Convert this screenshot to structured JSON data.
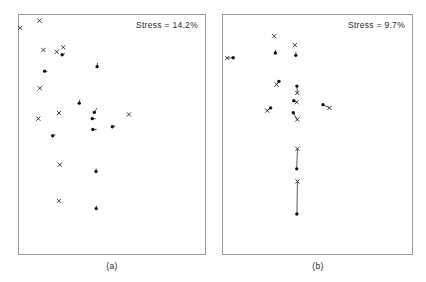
{
  "figure": {
    "type": "two-panel-mds-scatter",
    "background": "#ffffff",
    "marker_color": "#111111",
    "frame_color": "#9a9a9a"
  },
  "panels": [
    {
      "id": "a",
      "caption": "(a)",
      "stress_label": "Stress = 14.2%",
      "stress_value": 14.2
    },
    {
      "id": "b",
      "caption": "(b)",
      "stress_label": "Stress = 9.7%",
      "stress_value": 9.7
    }
  ],
  "chart_data": [
    {
      "type": "scatter",
      "panel": "a",
      "title": "Stress = 14.2%",
      "xlabel": "",
      "ylabel": "",
      "xlim": [
        0,
        188
      ],
      "ylim": [
        0,
        241
      ],
      "grid": false,
      "legend": "none",
      "axis_ticks": false,
      "note": "MDS configuration; cross markers are one configuration, filled circles the other, short line segments join corresponding pairs",
      "series": [
        {
          "name": "cross-markers",
          "marker": "x",
          "points": [
            {
              "x": 7,
              "y": 43
            },
            {
              "x": 110,
              "y": 19
            },
            {
              "x": 131,
              "y": 117
            },
            {
              "x": 112,
              "y": 245
            },
            {
              "x": 203,
              "y": 123
            },
            {
              "x": 238,
              "y": 108
            },
            {
              "x": 104,
              "y": 347
            },
            {
              "x": 215,
              "y": 328
            },
            {
              "x": 219,
              "y": 501
            },
            {
              "x": 215,
              "y": 622
            },
            {
              "x": 591,
              "y": 333
            }
          ]
        },
        {
          "name": "dot-markers",
          "marker": "circle",
          "points": [
            {
              "x": 232,
              "y": 133
            },
            {
              "x": 138,
              "y": 188
            },
            {
              "x": 420,
              "y": 173
            },
            {
              "x": 324,
              "y": 295
            },
            {
              "x": 405,
              "y": 326
            },
            {
              "x": 394,
              "y": 347
            },
            {
              "x": 397,
              "y": 383
            },
            {
              "x": 502,
              "y": 374
            },
            {
              "x": 181,
              "y": 404
            },
            {
              "x": 414,
              "y": 524
            },
            {
              "x": 415,
              "y": 648
            },
            {
              "x": 1166,
              "y": 325
            }
          ]
        }
      ],
      "pairs": [
        {
          "x1": 232,
          "y1": 133,
          "x2": 248,
          "y2": 129
        },
        {
          "x1": 138,
          "y1": 188,
          "x2": 153,
          "y2": 190
        },
        {
          "x1": 420,
          "y1": 173,
          "x2": 422,
          "y2": 160
        },
        {
          "x1": 324,
          "y1": 295,
          "x2": 327,
          "y2": 283
        },
        {
          "x1": 405,
          "y1": 326,
          "x2": 420,
          "y2": 311
        },
        {
          "x1": 394,
          "y1": 347,
          "x2": 413,
          "y2": 347
        },
        {
          "x1": 397,
          "y1": 383,
          "x2": 418,
          "y2": 383
        },
        {
          "x1": 502,
          "y1": 374,
          "x2": 519,
          "y2": 371
        },
        {
          "x1": 181,
          "y1": 404,
          "x2": 197,
          "y2": 401
        },
        {
          "x1": 414,
          "y1": 524,
          "x2": 415,
          "y2": 513
        },
        {
          "x1": 415,
          "y1": 648,
          "x2": 416,
          "y2": 638
        }
      ]
    },
    {
      "type": "scatter",
      "panel": "b",
      "title": "Stress = 9.7%",
      "xlabel": "",
      "ylabel": "",
      "xlim": [
        0,
        191
      ],
      "ylim": [
        0,
        241
      ],
      "grid": false,
      "legend": "none",
      "axis_ticks": false,
      "note": "MDS configuration with lower stress; paired markers lie closer together than in panel (a)",
      "series": [
        {
          "name": "cross-markers",
          "marker": "x",
          "points": [
            {
              "x": 22,
              "y": 144
            },
            {
              "x": 271,
              "y": 71
            },
            {
              "x": 380,
              "y": 101
            },
            {
              "x": 283,
              "y": 233
            },
            {
              "x": 393,
              "y": 261
            },
            {
              "x": 390,
              "y": 292
            },
            {
              "x": 393,
              "y": 350
            },
            {
              "x": 234,
              "y": 320
            },
            {
              "x": 563,
              "y": 311
            },
            {
              "x": 394,
              "y": 448
            },
            {
              "x": 394,
              "y": 557
            }
          ]
        },
        {
          "name": "dot-markers",
          "marker": "circle",
          "points": [
            {
              "x": 54,
              "y": 143
            },
            {
              "x": 277,
              "y": 127
            },
            {
              "x": 385,
              "y": 135
            },
            {
              "x": 296,
              "y": 222
            },
            {
              "x": 391,
              "y": 238
            },
            {
              "x": 374,
              "y": 287
            },
            {
              "x": 372,
              "y": 327
            },
            {
              "x": 252,
              "y": 311
            },
            {
              "x": 529,
              "y": 300
            },
            {
              "x": 390,
              "y": 515
            },
            {
              "x": 391,
              "y": 666
            }
          ]
        }
      ],
      "pairs": [
        {
          "x1": 22,
          "y1": 144,
          "x2": 54,
          "y2": 143
        },
        {
          "x1": 277,
          "y1": 127,
          "x2": 278,
          "y2": 116
        },
        {
          "x1": 385,
          "y1": 135,
          "x2": 386,
          "y2": 123
        },
        {
          "x1": 283,
          "y1": 233,
          "x2": 296,
          "y2": 222
        },
        {
          "x1": 393,
          "y1": 261,
          "x2": 391,
          "y2": 238
        },
        {
          "x1": 390,
          "y1": 292,
          "x2": 374,
          "y2": 287
        },
        {
          "x1": 393,
          "y1": 350,
          "x2": 372,
          "y2": 327
        },
        {
          "x1": 234,
          "y1": 320,
          "x2": 252,
          "y2": 311
        },
        {
          "x1": 563,
          "y1": 311,
          "x2": 529,
          "y2": 300
        },
        {
          "x1": 394,
          "y1": 448,
          "x2": 390,
          "y2": 515
        },
        {
          "x1": 394,
          "y1": 557,
          "x2": 391,
          "y2": 666
        }
      ]
    }
  ]
}
